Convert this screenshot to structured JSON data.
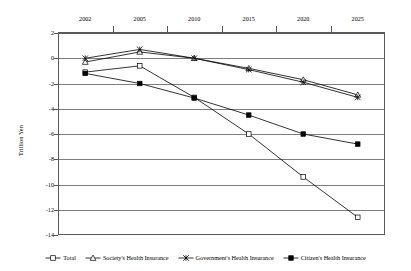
{
  "chart_data": {
    "type": "line",
    "title": "",
    "xlabel": "",
    "ylabel": "Trillion Yen",
    "categories": [
      "2002",
      "2005",
      "2010",
      "2015",
      "2020",
      "2025"
    ],
    "ylim": [
      -14,
      2
    ],
    "yticks": [
      2,
      0,
      -2,
      -4,
      -6,
      -8,
      -10,
      -12,
      -14
    ],
    "ytick_labels": [
      "2",
      "0",
      "-2",
      "-4",
      "-6",
      "-8",
      "-10",
      "-12",
      "-14"
    ],
    "grid": true,
    "legend_position": "bottom",
    "x_axis_position": "top",
    "series": [
      {
        "name": "Total",
        "marker": "open-square",
        "values": [
          -1.1,
          -0.6,
          -3.1,
          -6.0,
          -9.4,
          -12.6
        ]
      },
      {
        "name": "Society's Health Insurance",
        "marker": "open-triangle",
        "values": [
          -0.3,
          0.5,
          0.0,
          -0.8,
          -1.7,
          -2.9
        ]
      },
      {
        "name": "Government's Health Insurance",
        "marker": "cross-star",
        "values": [
          0.0,
          0.7,
          0.0,
          -0.9,
          -1.9,
          -3.1
        ]
      },
      {
        "name": "Citizen's Health Insurance",
        "marker": "filled-square",
        "values": [
          -1.2,
          -2.0,
          -3.15,
          -4.5,
          -6.0,
          -6.8
        ]
      }
    ]
  },
  "colors": {
    "line": "#000000",
    "grid": "#7d7d7d",
    "axis": "#5a5a5a",
    "background": "#ffffff"
  }
}
